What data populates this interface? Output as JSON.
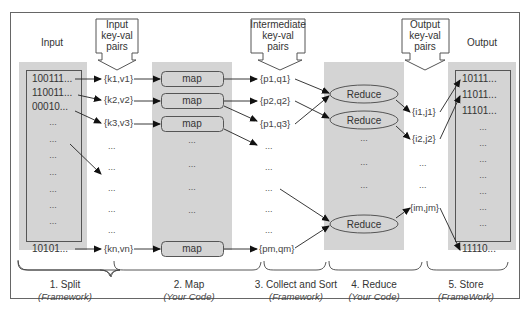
{
  "diagram": {
    "title_labels": {
      "input": "Input",
      "output": "Output",
      "input_kv": [
        "Input",
        "key-val",
        "pairs"
      ],
      "intermediate_kv": [
        "Intermediate",
        "key-val",
        "pairs"
      ],
      "output_kv": [
        "Output",
        "key-val",
        "pairs"
      ]
    },
    "input_records": [
      "100111...",
      "110011...",
      "00010...",
      "...",
      "...",
      "...",
      "...",
      "...",
      "...",
      "...",
      "10101..."
    ],
    "input_kv_pairs": [
      "{k1,v1}",
      "{k2,v2}",
      "{k3,v3}",
      "...",
      "...",
      "...",
      "...",
      "...",
      "{kn,vn}"
    ],
    "map_nodes": [
      "map",
      "map",
      "map",
      "...",
      "...",
      "...",
      "...",
      "map"
    ],
    "intermediate_pairs": [
      "{p1,q1}",
      "{p2,q2}",
      "{p1,q3}",
      "...",
      "...",
      "...",
      "...",
      "...",
      "{pm,qm}"
    ],
    "reduce_nodes": [
      "Reduce",
      "Reduce",
      "...",
      "...",
      "...",
      "Reduce"
    ],
    "output_pairs": [
      "{i1,j1}",
      "{i2,j2}",
      "...",
      "...",
      "{im,jm}"
    ],
    "output_records": [
      "10111...",
      "11011...",
      "11101...",
      "...",
      "...",
      "...",
      "...",
      "...",
      "...",
      "...",
      "11110..."
    ],
    "stages": [
      {
        "label": "1. Split",
        "sub": "(Framework)"
      },
      {
        "label": "2. Map",
        "sub": "(Your Code)"
      },
      {
        "label": "3. Collect and Sort",
        "sub": "(Framework)"
      },
      {
        "label": "4. Reduce",
        "sub": "(Your Code)"
      },
      {
        "label": "5. Store",
        "sub": "(FrameWork)"
      }
    ],
    "colors": {
      "column_fill": "#d4d4d4",
      "stroke": "#555555",
      "text": "#333333"
    }
  }
}
